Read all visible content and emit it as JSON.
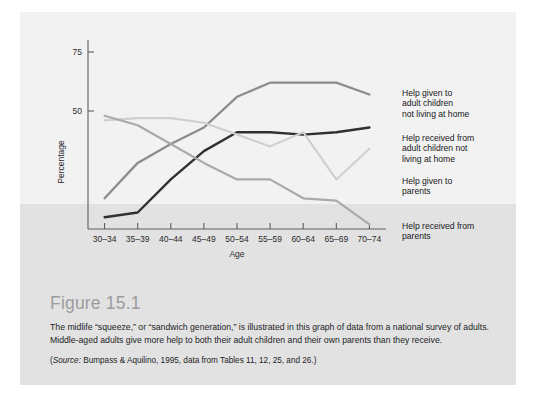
{
  "figure": {
    "title": "Figure 15.1",
    "caption": "The midlife “squeeze,” or “sandwich generation,” is illustrated in this graph of data from a national survey of adults. Middle-aged adults give more help to both their adult children and their own parents than they receive.",
    "source_label": "Source:",
    "source_text": " Bumpass & Aquilino, 1995, data from Tables 11, 12, 25, and 26.)",
    "source_open_paren": "("
  },
  "colors": {
    "panel_background": "#f2f2f2",
    "band_background": "#e2e2e2",
    "axis": "#5e5e5e",
    "title_gray": "#9c9c9c",
    "series_help_given_children": "#8c8c8c",
    "series_help_received_children": "#303030",
    "series_help_given_parents": "#cfcfcf",
    "series_help_received_parents": "#aaaaaa"
  },
  "chart_data": {
    "type": "line",
    "title": "",
    "xlabel": "Age",
    "ylabel": "Percentage",
    "categories": [
      "30–34",
      "35–39",
      "40–44",
      "45–49",
      "50–54",
      "55–59",
      "60–64",
      "65–69",
      "70–74"
    ],
    "ylim": [
      0,
      75
    ],
    "yticks": [
      50,
      75
    ],
    "ytick_labels": [
      "50",
      "75"
    ],
    "grid": false,
    "legend_position": "right-inline",
    "series": [
      {
        "name": "Help given to adult children not living at home",
        "color": "#8c8c8c",
        "values": [
          13,
          28,
          36,
          43,
          56,
          62,
          62,
          62,
          57
        ]
      },
      {
        "name": "Help received from adult children not living at home",
        "color": "#303030",
        "values": [
          5,
          7,
          21,
          33,
          41,
          41,
          40,
          41,
          43
        ]
      },
      {
        "name": "Help given to parents",
        "color": "#cfcfcf",
        "values": [
          46,
          47,
          47,
          45,
          40,
          35,
          41,
          21,
          34
        ]
      },
      {
        "name": "Help received from parents",
        "color": "#aaaaaa",
        "values": [
          48,
          44,
          36,
          28,
          21,
          21,
          13,
          12,
          2
        ]
      }
    ],
    "legend_labels": [
      {
        "lines": [
          "Help given to",
          "adult children",
          "not living at home"
        ]
      },
      {
        "lines": [
          "Help received from",
          "adult children not",
          "living at home"
        ]
      },
      {
        "lines": [
          "Help given to",
          "parents"
        ]
      },
      {
        "lines": [
          "Help received from",
          "parents"
        ]
      }
    ]
  }
}
